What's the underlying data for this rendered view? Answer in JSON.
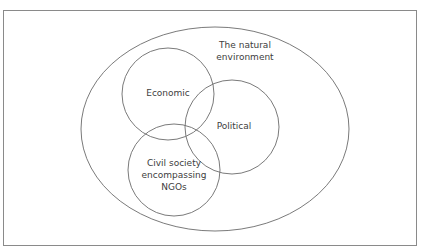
{
  "diagram": {
    "type": "venn",
    "colors": {
      "frame_border": "#8a8a8a",
      "stroke": "#6b6b6b",
      "text": "#404040",
      "background": "#ffffff"
    },
    "outer_set": {
      "label_lines": [
        "The natural",
        "environment"
      ],
      "shape": "ellipse",
      "cx": 215,
      "cy": 129,
      "rx": 134,
      "ry": 102
    },
    "sets": [
      {
        "id": "economic",
        "label_lines": [
          "Economic"
        ],
        "cx": 168,
        "cy": 94,
        "r": 46
      },
      {
        "id": "political",
        "label_lines": [
          "Political"
        ],
        "cx": 232,
        "cy": 127,
        "r": 47
      },
      {
        "id": "civil-society",
        "label_lines": [
          "Civil society",
          "encompassing",
          "NGOs"
        ],
        "cx": 174,
        "cy": 170,
        "r": 46
      }
    ]
  }
}
